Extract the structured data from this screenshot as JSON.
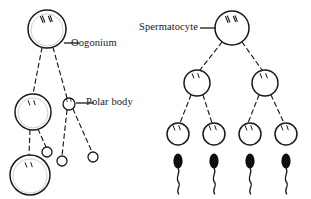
{
  "figure": {
    "title": "",
    "background_color": "#ffffff",
    "stroke_color": "#1a1a1a",
    "fill_color": "#ffffff",
    "sperm_color": "#000000"
  },
  "labels": {
    "oogonium": "Oogonium",
    "polar_body": "Polar body",
    "spermatocyte": "Spermatocyte"
  },
  "oogenesis": {
    "cells": [
      {
        "name": "oogonium",
        "cx": 47,
        "cy": 29,
        "r": 19,
        "chromosomes": 2
      },
      {
        "name": "secondary-oocyte",
        "cx": 33,
        "cy": 112,
        "r": 18,
        "chromosomes": 2
      },
      {
        "name": "ovum",
        "cx": 30,
        "cy": 175,
        "r": 20,
        "chromosomes": 2
      }
    ],
    "polar_bodies": [
      {
        "name": "first-polar-body",
        "cx": 69,
        "cy": 104,
        "r": 6
      },
      {
        "name": "polar-body-small-a",
        "cx": 47,
        "cy": 152,
        "r": 5
      },
      {
        "name": "polar-body-small-b",
        "cx": 62,
        "cy": 161,
        "r": 5
      },
      {
        "name": "polar-body-small-c",
        "cx": 93,
        "cy": 157,
        "r": 5
      }
    ]
  },
  "spermatogenesis": {
    "cells": [
      {
        "name": "primary-spermatocyte",
        "cx": 232,
        "cy": 28,
        "r": 17,
        "chromosomes": 2
      },
      {
        "name": "secondary-spermatocyte-left",
        "cx": 197,
        "cy": 83,
        "r": 13,
        "chromosomes": 2
      },
      {
        "name": "secondary-spermatocyte-right",
        "cx": 265,
        "cy": 83,
        "r": 13,
        "chromosomes": 2
      },
      {
        "name": "spermatid-1",
        "cx": 178,
        "cy": 134,
        "r": 11,
        "chromosomes": 2
      },
      {
        "name": "spermatid-2",
        "cx": 214,
        "cy": 134,
        "r": 11,
        "chromosomes": 2
      },
      {
        "name": "spermatid-3",
        "cx": 250,
        "cy": 134,
        "r": 11,
        "chromosomes": 2
      },
      {
        "name": "spermatid-4",
        "cx": 286,
        "cy": 134,
        "r": 11,
        "chromosomes": 2
      }
    ],
    "sperm": [
      {
        "name": "sperm-1",
        "x": 178,
        "y": 157
      },
      {
        "name": "sperm-2",
        "x": 214,
        "y": 157
      },
      {
        "name": "sperm-3",
        "x": 250,
        "y": 157
      },
      {
        "name": "sperm-4",
        "x": 286,
        "y": 157
      }
    ]
  }
}
